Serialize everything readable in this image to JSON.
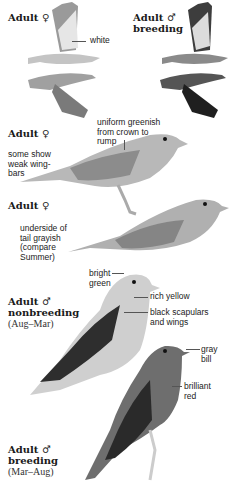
{
  "top_fragment": "··",
  "figures": [
    {
      "id": "flight-female",
      "heading": "Adult ♀",
      "sublabel": "",
      "annotations": [
        "white"
      ]
    },
    {
      "id": "flight-male-breeding",
      "heading": "Adult ♂",
      "heading2": "breeding",
      "sublabel": ""
    },
    {
      "id": "female-1",
      "heading": "Adult ♀",
      "annotations": [
        "uniform greenish from crown to rump",
        "some show weak wing-bars"
      ]
    },
    {
      "id": "female-2",
      "heading": "Adult ♀",
      "annotations": [
        "underside of tail grayish (compare Summer)"
      ]
    },
    {
      "id": "male-nonbreeding",
      "heading": "Adult ♂",
      "heading2": "nonbreeding",
      "sublabel": "(Aug–Mar)",
      "annotations": [
        "bright green",
        "rich yellow",
        "black scapulars and wings"
      ]
    },
    {
      "id": "male-breeding",
      "heading": "Adult ♂",
      "heading2": "breeding",
      "sublabel": "(Mar–Aug)",
      "annotations": [
        "gray bill",
        "brilliant red"
      ]
    }
  ],
  "labels": {
    "h1": "Adult ♀",
    "h2a": "Adult ♂",
    "h2b": "breeding",
    "white": "white",
    "uniform1": "uniform greenish",
    "uniform2": "from crown to",
    "uniform3": "rump",
    "h3": "Adult ♀",
    "weak1": "some show",
    "weak2": "weak wing-",
    "weak3": "bars",
    "h4": "Adult ♀",
    "under1": "underside of",
    "under2": "tail grayish",
    "under3": "(compare",
    "under4": "Summer)",
    "bright1": "bright",
    "bright2": "green",
    "rich": "rich yellow",
    "black1": "black scapulars",
    "black2": "and wings",
    "h5a": "Adult ♂",
    "h5b": "nonbreeding",
    "h5c": "(Aug–Mar)",
    "gray1": "gray",
    "gray2": "bill",
    "red1": "brilliant",
    "red2": "red",
    "h6a": "Adult ♂",
    "h6b": "breeding",
    "h6c": "(Mar–Aug)"
  },
  "colors": {
    "ink": "#222222",
    "bg": "#ffffff",
    "bird_light": "#bdbdbd",
    "bird_mid": "#8a8a8a",
    "bird_dark": "#3a3a3a"
  }
}
